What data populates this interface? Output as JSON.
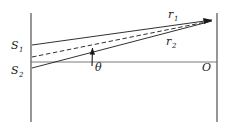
{
  "figure": {
    "kind": "optics-ray-diagram",
    "caption": "",
    "background_color": "#ffffff",
    "line_color": "#1a1a1a",
    "axis_color": "#555555",
    "labels": {
      "source_upper": "S",
      "source_upper_sub": "1",
      "source_lower": "S",
      "source_lower_sub": "2",
      "ray_upper": "r",
      "ray_upper_sub": "1",
      "ray_lower": "r",
      "ray_lower_sub": "2",
      "angle": "θ",
      "origin": "O"
    },
    "elements": {
      "slit_barrier": "left-vertical-line",
      "screen": "right-vertical-line",
      "optical_axis": "horizontal-axis-line",
      "bisector": "dashed-center-line",
      "ray_arrow": "arrowhead-at-screen",
      "angle_arrow": "theta-indicator-arrow"
    },
    "geometry": {
      "barrier_x": 31,
      "barrier_y_top": 13,
      "barrier_y_bottom": 122,
      "screen_x": 217,
      "screen_y_top": 13,
      "screen_y_bottom": 122,
      "s1_point": [
        31,
        45
      ],
      "s2_point": [
        31,
        68
      ],
      "axis_y": 62,
      "target_point": [
        214,
        20
      ],
      "theta_vertex": [
        92,
        62
      ],
      "theta_label_pos": [
        95,
        70
      ],
      "origin_label_pos": [
        204,
        70
      ]
    }
  }
}
